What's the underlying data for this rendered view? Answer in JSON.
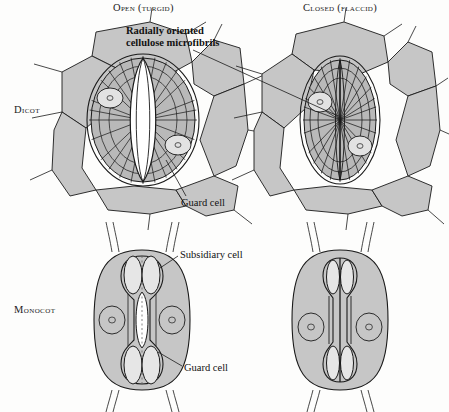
{
  "figure": {
    "title_columns": [
      {
        "id": "open",
        "label": "Open (turgid)"
      },
      {
        "id": "closed",
        "label": "Closed (flaccid)"
      }
    ],
    "row_labels": [
      {
        "id": "dicot",
        "label": "Dicot"
      },
      {
        "id": "monocot",
        "label": "Monocot"
      }
    ],
    "annotations": [
      {
        "id": "microfibrils",
        "line1": "Radially oriented",
        "line2": "cellulose microfibrils",
        "bold": true
      },
      {
        "id": "guard-cell-dicot",
        "label": "Guard cell",
        "bold": false
      },
      {
        "id": "subsidiary-cell",
        "label": "Subsidiary cell",
        "bold": false
      },
      {
        "id": "guard-cell-monocot",
        "label": "Guard cell",
        "bold": false
      }
    ],
    "colors": {
      "background": "#fdfdfc",
      "epidermis_fill": "#c6c6c6",
      "guard_cell_fill": "#b9b9b9",
      "nucleus_fill": "#e2e2e2",
      "pore_fill": "#ffffff",
      "bulb_fill": "#e6e6e6",
      "outline": "#1a1a1a",
      "text": "#1a1a1a"
    },
    "panels": [
      {
        "id": "dicot-open",
        "row": "dicot",
        "state": "open",
        "pore_open": true,
        "nuclei": 2,
        "microfibril_lines": 26
      },
      {
        "id": "dicot-closed",
        "row": "dicot",
        "state": "closed",
        "pore_open": false,
        "nuclei": 2,
        "microfibril_lines": 26
      },
      {
        "id": "monocot-open",
        "row": "monocot",
        "state": "open",
        "pore_open": true,
        "nuclei": 2,
        "microfibril_lines": 0
      },
      {
        "id": "monocot-closed",
        "row": "monocot",
        "state": "closed",
        "pore_open": false,
        "nuclei": 2,
        "microfibril_lines": 0
      }
    ]
  }
}
